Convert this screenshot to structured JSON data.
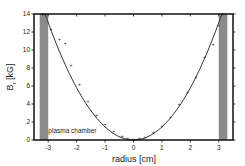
{
  "chart_data": {
    "type": "scatter",
    "title": "",
    "xlabel": "radius [cm]",
    "ylabel": "B",
    "ylabel_subscript": "r",
    "ylabel_unit": "[kG]",
    "xlim": [
      -3.5,
      3.5
    ],
    "ylim": [
      0,
      14
    ],
    "x_ticks": [
      -3,
      -2,
      -1,
      0,
      1,
      2,
      3
    ],
    "y_ticks": [
      0,
      2,
      4,
      6,
      8,
      10,
      12,
      14
    ],
    "grid": false,
    "legend": null,
    "annotations": [
      {
        "text": "plasma chamber",
        "x": -3.1,
        "y": 0.8
      }
    ],
    "shaded_regions": [
      {
        "name": "chamber-wall-left",
        "x_from": -3.3,
        "x_to": -3.0,
        "color": "#8a8a8a"
      },
      {
        "name": "chamber-wall-right",
        "x_from": 3.0,
        "x_to": 3.3,
        "color": "#8a8a8a"
      }
    ],
    "series": [
      {
        "name": "measured",
        "style": "markers",
        "x": [
          -3.2,
          -2.9,
          -2.6,
          -2.4,
          -2.2,
          -1.9,
          -1.6,
          -1.3,
          -1.0,
          -0.7,
          -0.4,
          -0.2,
          0.0,
          0.2,
          0.4,
          0.7,
          1.0,
          1.3,
          1.6,
          1.9,
          2.2,
          2.5,
          2.8,
          3.0
        ],
        "y": [
          14.0,
          12.3,
          11.2,
          10.8,
          8.3,
          6.2,
          4.3,
          2.8,
          1.8,
          1.0,
          0.4,
          0.2,
          0.1,
          0.2,
          0.3,
          0.9,
          1.6,
          2.6,
          4.0,
          5.3,
          7.0,
          9.2,
          10.7,
          12.8
        ]
      },
      {
        "name": "fit",
        "style": "line",
        "equation": "B = 1.45 * r^2",
        "x_range": [
          -3.2,
          3.2
        ]
      }
    ]
  }
}
